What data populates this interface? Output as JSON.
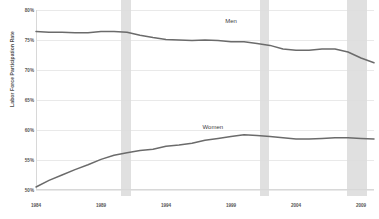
{
  "chart_data": {
    "type": "line",
    "title": "",
    "xlabel": "",
    "ylabel": "Labor Force Participation Rate",
    "xlim": [
      1984,
      2010
    ],
    "ylim": [
      50,
      80
    ],
    "grid": true,
    "legend_position": "inline-annotation",
    "y_ticks": [
      80,
      75,
      70,
      65,
      60,
      55,
      50
    ],
    "y_tick_labels": [
      "80%",
      "75%",
      "70%",
      "65%",
      "60%",
      "55%",
      "50%"
    ],
    "x_ticks": [
      1984,
      1989,
      1994,
      1999,
      2004,
      2009
    ],
    "x_tick_labels": [
      "1984",
      "1989",
      "1994",
      "1999",
      "2004",
      "2009"
    ],
    "line_color": "#6b6b6b",
    "recession_color": "#dcdcdc",
    "gridline_color": "#e9e9e9",
    "recession_bands": [
      {
        "start": 1990.5,
        "end": 1991.3
      },
      {
        "start": 2001.2,
        "end": 2001.9
      },
      {
        "start": 2007.9,
        "end": 2009.5
      }
    ],
    "series": [
      {
        "name": "Men",
        "label": "Men",
        "label_x": 1999.0,
        "label_y": 78.2,
        "x": [
          1984,
          1985,
          1986,
          1987,
          1988,
          1989,
          1990,
          1991,
          1992,
          1993,
          1994,
          1995,
          1996,
          1997,
          1998,
          1999,
          2000,
          2001,
          2002,
          2003,
          2004,
          2005,
          2006,
          2007,
          2008,
          2009,
          2010
        ],
        "values": [
          76.4,
          76.3,
          76.3,
          76.2,
          76.2,
          76.4,
          76.4,
          76.3,
          75.8,
          75.4,
          75.1,
          75.0,
          74.9,
          75.0,
          74.9,
          74.7,
          74.7,
          74.4,
          74.1,
          73.5,
          73.3,
          73.3,
          73.5,
          73.5,
          73.0,
          72.0,
          71.2
        ],
        "color": "#6b6b6b"
      },
      {
        "name": "Women",
        "label": "Women",
        "label_x": 1997.6,
        "label_y": 60.5,
        "x": [
          1984,
          1985,
          1986,
          1987,
          1988,
          1989,
          1990,
          1991,
          1992,
          1993,
          1994,
          1995,
          1996,
          1997,
          1998,
          1999,
          2000,
          2001,
          2002,
          2003,
          2004,
          2005,
          2006,
          2007,
          2008,
          2009,
          2010
        ],
        "values": [
          50.5,
          51.6,
          52.5,
          53.4,
          54.2,
          55.1,
          55.8,
          56.2,
          56.6,
          56.8,
          57.3,
          57.5,
          57.8,
          58.3,
          58.6,
          58.9,
          59.2,
          59.1,
          58.9,
          58.7,
          58.5,
          58.5,
          58.6,
          58.7,
          58.7,
          58.6,
          58.5
        ],
        "color": "#6b6b6b"
      }
    ]
  }
}
